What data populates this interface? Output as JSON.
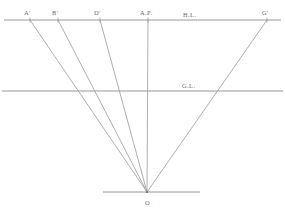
{
  "canvas": {
    "width": 285,
    "height": 214,
    "background": "#ffffff",
    "line_color": "#8d8d8d",
    "ray_color": "#9a9a9a",
    "label_color": "#6a6a6a"
  },
  "diagram": {
    "type": "line-drawing"
  },
  "horizon_line": {
    "label": "H.L.",
    "label_x": 183,
    "label_y": 12,
    "y": 20,
    "x_start": 4,
    "x_end": 281
  },
  "ground_line": {
    "label": "G.L.",
    "label_x": 182,
    "label_y": 83,
    "y": 91,
    "x_start": 2,
    "x_end": 283
  },
  "station_point": {
    "label": "O",
    "label_x": 145,
    "label_y": 200,
    "x": 147,
    "y": 192
  },
  "base_line": {
    "y": 192,
    "x_start": 103,
    "x_end": 200
  },
  "horizon_points": [
    {
      "label": "A'",
      "x": 30,
      "label_x": 24,
      "label_y": 10,
      "tick": true
    },
    {
      "label": "B'",
      "x": 58,
      "label_x": 52,
      "label_y": 10,
      "tick": true
    },
    {
      "label": "D'",
      "x": 100,
      "label_x": 94,
      "label_y": 10,
      "tick": true
    },
    {
      "label": "A.P.",
      "x": 148,
      "label_x": 140,
      "label_y": 10,
      "tick": true
    },
    {
      "label": "G'",
      "x": 267,
      "label_x": 262,
      "label_y": 10,
      "tick": true
    }
  ],
  "rays": [
    {
      "name": "ray-a-prime",
      "from_label": "A'",
      "x1": 30,
      "y1": 20,
      "x2": 147,
      "y2": 192
    },
    {
      "name": "ray-b-prime",
      "from_label": "B'",
      "x1": 58,
      "y1": 20,
      "x2": 147,
      "y2": 192
    },
    {
      "name": "ray-d-prime",
      "from_label": "D'",
      "x1": 100,
      "y1": 20,
      "x2": 147,
      "y2": 192
    },
    {
      "name": "ray-axis-point",
      "from_label": "A.P.",
      "x1": 148,
      "y1": 20,
      "x2": 147,
      "y2": 192
    },
    {
      "name": "ray-g-prime",
      "from_label": "G'",
      "x1": 267,
      "y1": 20,
      "x2": 147,
      "y2": 192
    }
  ]
}
